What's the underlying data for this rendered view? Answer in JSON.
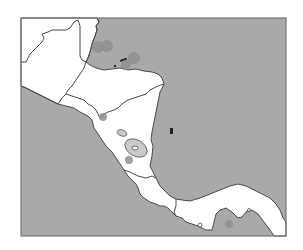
{
  "map": {
    "region": "Central America",
    "style": "grayscale outline map",
    "colors": {
      "sea": "#a9a9a9",
      "land": "#ffffff",
      "border": "#4a4a4a",
      "marker": "#8f8f8f",
      "lake": "#c9c9c9",
      "frame": "#777777"
    },
    "countries": [
      "Guatemala",
      "Belize",
      "Honduras",
      "El Salvador",
      "Nicaragua",
      "Costa Rica",
      "Panama"
    ],
    "markers": [
      {
        "id": "marker-belize-coast-1",
        "location": "Belize coast"
      },
      {
        "id": "marker-belize-coast-2",
        "location": "Gulf of Honduras"
      },
      {
        "id": "marker-bay-islands",
        "location": "Bay Islands, Honduras"
      },
      {
        "id": "marker-honduras-north-coast",
        "location": "North coast of Honduras"
      },
      {
        "id": "marker-gulf-of-fonseca",
        "location": "Gulf of Fonseca"
      },
      {
        "id": "marker-nicaragua-pacific",
        "location": "Pacific coast of Nicaragua"
      },
      {
        "id": "marker-panama-gulf",
        "location": "Gulf of Panama"
      }
    ]
  }
}
